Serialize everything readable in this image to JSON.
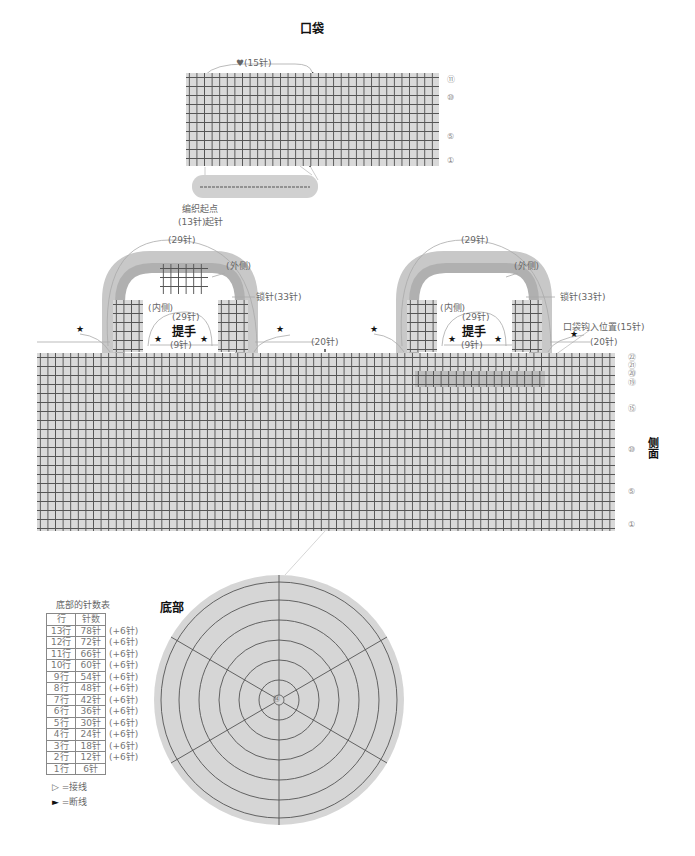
{
  "pocket": {
    "title": "口袋",
    "heart_label": "♥(15针)",
    "start_label_line1": "编织起点",
    "start_label_line2": "(13针)起针",
    "row_markers": [
      "⑪",
      "⑩",
      "⑤",
      "①"
    ]
  },
  "handles": {
    "left": {
      "title": "提手",
      "outer_width": "(29针)",
      "outer_label": "(外侧)",
      "inner_label": "(内侧)",
      "inner_width": "(29针)",
      "chain_label": "锁针(33针)",
      "gap_label": "(9针)"
    },
    "right": {
      "title": "提手",
      "outer_width": "(29针)",
      "outer_label": "(外侧)",
      "inner_label": "(内侧)",
      "inner_width": "(29针)",
      "chain_label": "锁针(33针)",
      "gap_label": "(9针)"
    },
    "star": "★"
  },
  "side": {
    "title": "侧面",
    "center_label": "(20针)",
    "right_label": "(20针)",
    "pocket_position_label": "口袋钩入位置(15针)",
    "row_markers": [
      "㉒",
      "㉑",
      "⑳",
      "⑲",
      "⑮",
      "⑩",
      "⑤",
      "①"
    ]
  },
  "bottom": {
    "title": "底部",
    "center_marker": "⑭",
    "table_title": "底部的针数表",
    "table_headers": [
      "行",
      "针数"
    ],
    "table_rows": [
      {
        "row": "13行",
        "count": "78针",
        "inc": "(+6针)"
      },
      {
        "row": "12行",
        "count": "72针",
        "inc": "(+6针)"
      },
      {
        "row": "11行",
        "count": "66针",
        "inc": "(+6针)"
      },
      {
        "row": "10行",
        "count": "60针",
        "inc": "(+6针)"
      },
      {
        "row": "9行",
        "count": "54针",
        "inc": "(+6针)"
      },
      {
        "row": "8行",
        "count": "48针",
        "inc": "(+6针)"
      },
      {
        "row": "7行",
        "count": "42针",
        "inc": "(+6针)"
      },
      {
        "row": "6行",
        "count": "36针",
        "inc": "(+6针)"
      },
      {
        "row": "5行",
        "count": "30针",
        "inc": "(+6针)"
      },
      {
        "row": "4行",
        "count": "24针",
        "inc": "(+6针)"
      },
      {
        "row": "3行",
        "count": "18针",
        "inc": "(+6针)"
      },
      {
        "row": "2行",
        "count": "12针",
        "inc": "(+6针)"
      },
      {
        "row": "1行",
        "count": "6针",
        "inc": ""
      }
    ]
  },
  "legend": {
    "join": {
      "symbol": "▷",
      "text": "=接线"
    },
    "cut": {
      "symbol": "►",
      "text": "=断线"
    }
  },
  "colors": {
    "fabric": "#d9d9d9",
    "fabric_dark": "#bdbdbd",
    "handle_outer": "#c8c8c8",
    "handle_inner": "#b0b0b0",
    "stitch": "#555555",
    "label": "#666666"
  }
}
